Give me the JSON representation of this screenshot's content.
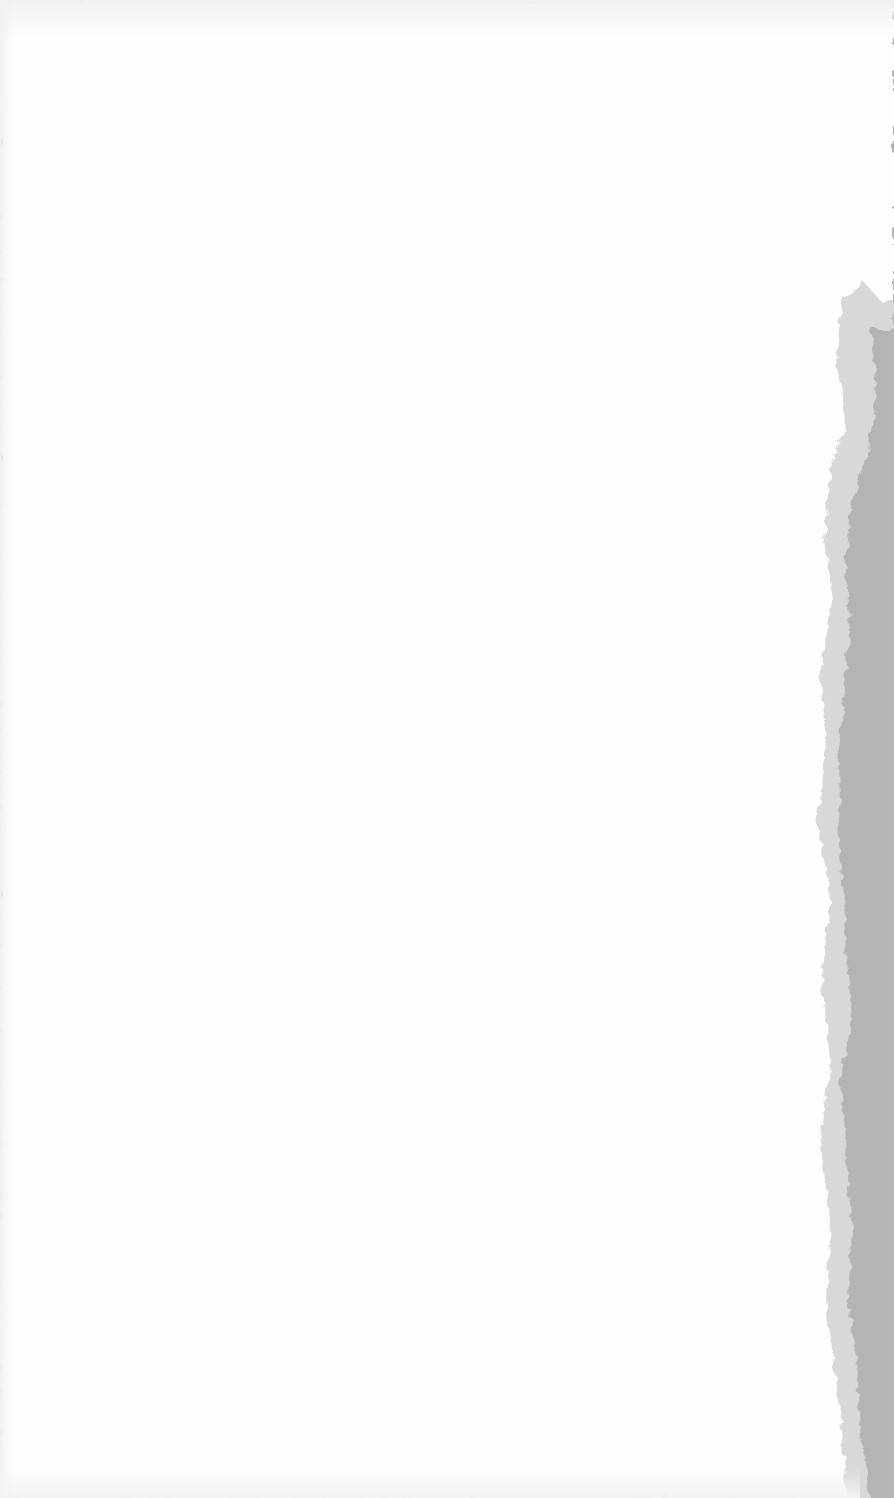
{
  "scene": {
    "description": "Blank white paper sheet with torn right edge revealing gray background",
    "colors": {
      "paper": "#fefefe",
      "background": "#b4b4b4",
      "torn_edge_shadow": "#d6d6d6"
    }
  }
}
